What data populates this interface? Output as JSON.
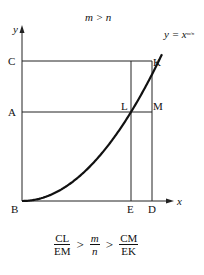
{
  "title": "m > n",
  "curve_label": "y = x",
  "curve_exponent": "m/n",
  "axes": {
    "x_label": "x",
    "y_label": "y"
  },
  "points": {
    "B": "B",
    "C": "C",
    "A": "A",
    "K": "K",
    "L": "L",
    "M": "M",
    "E": "E",
    "D": "D"
  },
  "formula": {
    "left": {
      "num": "CL",
      "den": "EM"
    },
    "mid": {
      "num": "m",
      "den": "n"
    },
    "right": {
      "num": "CM",
      "den": "EK"
    },
    "op1": ">",
    "op2": ">"
  }
}
